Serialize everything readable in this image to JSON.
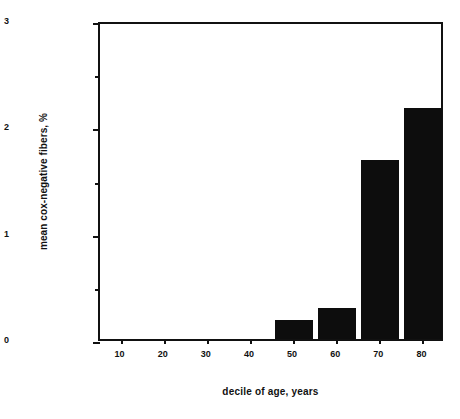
{
  "chart_data": {
    "type": "bar",
    "title": "",
    "subtitle": "",
    "xlabel": "decile of age, years",
    "ylabel": "mean cox-negative fibers, %",
    "categories": [
      "10",
      "20",
      "30",
      "40",
      "50",
      "60",
      "70",
      "80"
    ],
    "values": [
      0,
      0,
      0,
      0,
      0.18,
      0.29,
      1.68,
      2.17
    ],
    "series": [
      {
        "name": "mean cox-negative fibers",
        "values": [
          0,
          0,
          0,
          0,
          0.18,
          0.29,
          1.68,
          2.17
        ]
      }
    ],
    "xlim": [
      5,
      85
    ],
    "ylim": [
      0,
      3
    ],
    "y_major_ticks": [
      "0",
      "1",
      "2",
      "3"
    ],
    "y_major_tick_values": [
      0,
      1,
      2,
      3
    ],
    "y_minor_tick_values": [
      0.5,
      1.5,
      2.5
    ],
    "x_tick_labels": [
      "10",
      "20",
      "30",
      "40",
      "50",
      "60",
      "70",
      "80"
    ],
    "x_tick_values": [
      10,
      20,
      30,
      40,
      50,
      60,
      70,
      80
    ],
    "grid": false,
    "legend": false,
    "legend_position": "none",
    "bar_color": "#0d0d0d",
    "axis_color": "#111111",
    "background_color": "#ffffff",
    "annotations": []
  },
  "axes": {
    "x_title": "decile of age, years",
    "y_title": "mean cox-negative fibers, %"
  },
  "ticks": {
    "y_labels": [
      {
        "text": "0",
        "value": 0
      },
      {
        "text": "1",
        "value": 1
      },
      {
        "text": "2",
        "value": 2
      },
      {
        "text": "3",
        "value": 3
      }
    ],
    "y_minor": [
      0.5,
      1.5,
      2.5
    ],
    "x_labels": [
      {
        "text": "10",
        "value": 10
      },
      {
        "text": "20",
        "value": 20
      },
      {
        "text": "30",
        "value": 30
      },
      {
        "text": "40",
        "value": 40
      },
      {
        "text": "50",
        "value": 50
      },
      {
        "text": "60",
        "value": 60
      },
      {
        "text": "70",
        "value": 70
      },
      {
        "text": "80",
        "value": 80
      }
    ]
  },
  "bars": [
    {
      "category": "10",
      "value": 0
    },
    {
      "category": "20",
      "value": 0
    },
    {
      "category": "30",
      "value": 0
    },
    {
      "category": "40",
      "value": 0
    },
    {
      "category": "50",
      "value": 0.18
    },
    {
      "category": "60",
      "value": 0.29
    },
    {
      "category": "70",
      "value": 1.68
    },
    {
      "category": "80",
      "value": 2.17
    }
  ]
}
